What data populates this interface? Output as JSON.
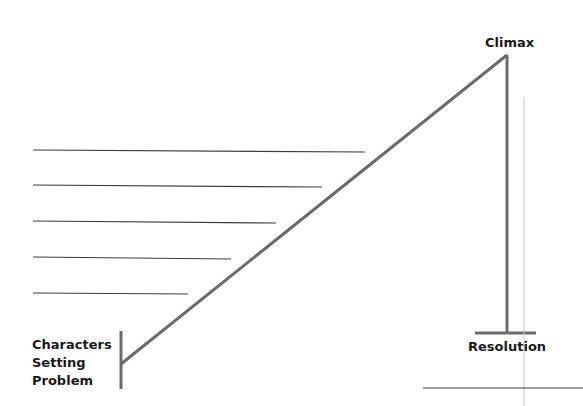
{
  "diagram": {
    "labels": {
      "climax": "Climax",
      "resolution": "Resolution",
      "exposition": [
        "Characters",
        "Setting",
        "Problem"
      ]
    },
    "colors": {
      "line": "#6b6b6b",
      "text": "#1a1a1a"
    },
    "writing_lines": 5
  }
}
